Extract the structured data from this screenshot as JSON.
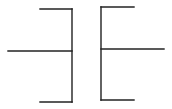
{
  "diagram": {
    "type": "capacitor-symbol",
    "stroke_color": "#222222",
    "stroke_width": 1.4,
    "left_plate": {
      "name": "left-bracket",
      "lead": {
        "x1": 8,
        "y1": 51,
        "x2": 72,
        "y2": 51
      },
      "spine": {
        "x1": 72,
        "y1": 9,
        "x2": 72,
        "y2": 102
      },
      "top_arm": {
        "x1": 40,
        "y1": 9,
        "x2": 72,
        "y2": 9
      },
      "bottom_arm": {
        "x1": 40,
        "y1": 102,
        "x2": 72,
        "y2": 102
      }
    },
    "right_plate": {
      "name": "right-bracket",
      "lead": {
        "x1": 101,
        "y1": 49,
        "x2": 164,
        "y2": 49
      },
      "spine": {
        "x1": 101,
        "y1": 7,
        "x2": 101,
        "y2": 100
      },
      "top_arm": {
        "x1": 101,
        "y1": 7,
        "x2": 134,
        "y2": 7
      },
      "bottom_arm": {
        "x1": 101,
        "y1": 100,
        "x2": 134,
        "y2": 100
      }
    }
  }
}
